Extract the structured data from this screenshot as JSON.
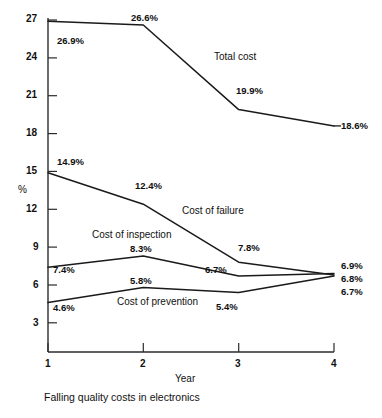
{
  "chart_data": {
    "type": "line",
    "title": "",
    "caption": "Falling quality costs in electronics",
    "xlabel": "Year",
    "ylabel": "%",
    "x": [
      1,
      2,
      3,
      4
    ],
    "xticklabels": [
      "1",
      "2",
      "3",
      "4"
    ],
    "xlim": [
      1,
      4
    ],
    "ylim": [
      0,
      27.9
    ],
    "yticks": [
      3,
      6,
      9,
      12,
      15,
      18,
      21,
      24,
      27
    ],
    "yticklabels": [
      "3",
      "6",
      "9",
      "12",
      "15",
      "18",
      "21",
      "24",
      "27"
    ],
    "grid": false,
    "legend": "inline-annotations",
    "line_color": "#1a1a1a",
    "series": [
      {
        "name": "Total cost",
        "values": [
          26.9,
          26.6,
          19.9,
          18.6
        ],
        "point_labels": [
          "26.9%",
          "26.6%",
          "19.9%",
          "18.6%"
        ]
      },
      {
        "name": "Cost of failure",
        "values": [
          14.9,
          12.4,
          7.8,
          6.8
        ],
        "point_labels": [
          "14.9%",
          "12.4%",
          "7.8%",
          "6.8%"
        ]
      },
      {
        "name": "Cost of inspection",
        "values": [
          7.4,
          8.3,
          6.7,
          6.9
        ],
        "point_labels": [
          "7.4%",
          "8.3%",
          "6.7%",
          "6.9%"
        ]
      },
      {
        "name": "Cost of prevention",
        "values": [
          4.6,
          5.8,
          5.4,
          6.7
        ],
        "point_labels": [
          "4.6%",
          "5.8%",
          "5.4%",
          "6.7%"
        ]
      }
    ]
  },
  "annotations": {
    "total_cost_label": "Total cost",
    "failure_label": "Cost of failure",
    "inspection_label": "Cost of inspection",
    "prevention_label": "Cost of prevention",
    "p_26_9": "26.9%",
    "p_26_6": "26.6%",
    "p_19_9": "19.9%",
    "p_18_6": "18.6%",
    "p_14_9": "14.9%",
    "p_12_4": "12.4%",
    "p_7_8": "7.8%",
    "p_6_9": "6.9%",
    "p_6_8": "6.8%",
    "p_6_7_end": "6.7%",
    "p_7_4": "7.4%",
    "p_8_3": "8.3%",
    "p_6_7_yr3": "6.7%",
    "p_4_6": "4.6%",
    "p_5_8": "5.8%",
    "p_5_4": "5.4%"
  },
  "axis": {
    "y_title": "%",
    "x_title": "Year",
    "y_27": "27",
    "y_24": "24",
    "y_21": "21",
    "y_18": "18",
    "y_15": "15",
    "y_12": "12",
    "y_9": "9",
    "y_6": "6",
    "y_3": "3",
    "x_1": "1",
    "x_2": "2",
    "x_3": "3",
    "x_4": "4"
  },
  "caption": {
    "text": "Falling quality costs in electronics"
  }
}
